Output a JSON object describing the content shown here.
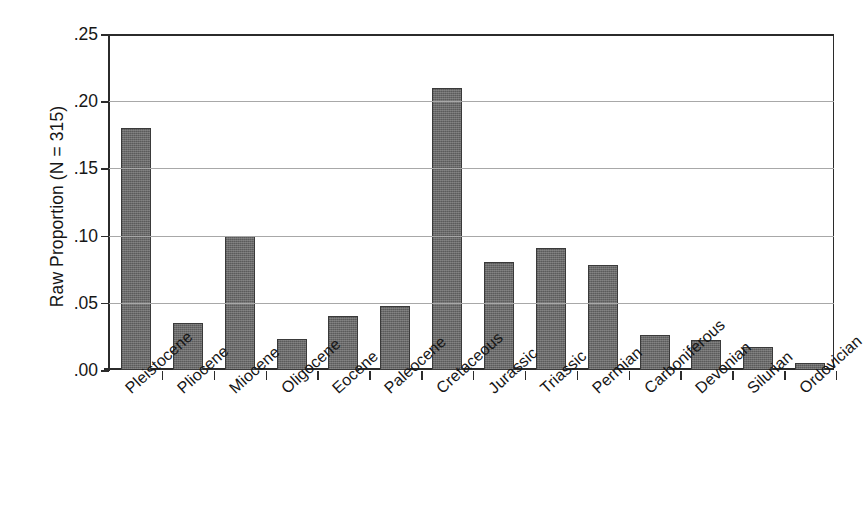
{
  "chart_data": {
    "type": "bar",
    "title": "",
    "subtitle": "",
    "xlabel": "",
    "ylabel": "Raw Proportion (N = 315)",
    "sample_size": 315,
    "categories": [
      "Pleistocene",
      "Pliocene",
      "Miocene",
      "Oligocene",
      "Eocene",
      "Paleocene",
      "Cretaceous",
      "Jurassic",
      "Triassic",
      "Permian",
      "Carboniferous",
      "Devonian",
      "Silurian",
      "Ordovician"
    ],
    "values": [
      0.18,
      0.035,
      0.1,
      0.023,
      0.04,
      0.048,
      0.21,
      0.08,
      0.091,
      0.078,
      0.026,
      0.022,
      0.017,
      0.005
    ],
    "ylim": [
      0.0,
      0.25
    ],
    "ytick_values": [
      0.0,
      0.05,
      0.1,
      0.15,
      0.2,
      0.25
    ],
    "ytick_labels": [
      ".00",
      ".05",
      ".10",
      ".15",
      ".20",
      ".25"
    ],
    "grid": true,
    "grid_axis": "y",
    "legend": false,
    "legend_position": "none",
    "bar_color": "#6a6a6a",
    "bar_edge_color": "#3a3a3a",
    "gridline_color": "#a8a8a8",
    "axis_color": "#2b2b2b",
    "xtick_label_rotation": -42
  },
  "figure": {
    "background": "#ffffff",
    "text_color": "#161616"
  }
}
